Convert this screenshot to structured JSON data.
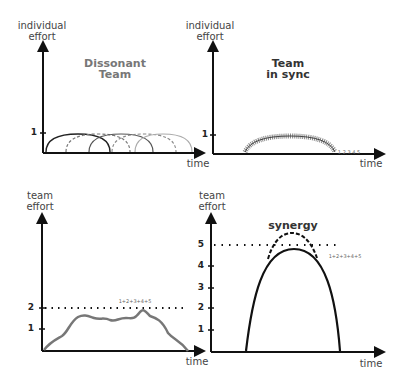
{
  "panels": {
    "top_left": {
      "y_label_line1": "individual",
      "y_label_line2": "effort",
      "x_label": "time",
      "title_line1": "Dissonant",
      "title_line2": "Team",
      "y_tick": "1",
      "arc_labels": [
        "1",
        "2",
        "3",
        "4",
        "5"
      ]
    },
    "top_right": {
      "y_label_line1": "individual",
      "y_label_line2": "effort",
      "x_label": "time",
      "title_line1": "Team",
      "title_line2": "in sync",
      "y_tick": "1",
      "arc_label": "1,2,3,4,5"
    },
    "bottom_left": {
      "y_label_line1": "team",
      "y_label_line2": "effort",
      "x_label": "time",
      "y_ticks": [
        "1",
        "2"
      ],
      "sum_label": "1+2+3+4+5"
    },
    "bottom_right": {
      "y_label_line1": "team",
      "y_label_line2": "effort",
      "x_label": "time",
      "title": "synergy",
      "y_ticks": [
        "1",
        "2",
        "3",
        "4",
        "5"
      ],
      "sum_label": "1+2+3+4+5"
    }
  },
  "colors": {
    "axis": "#111111",
    "curve_dark": "#222222",
    "curve_gray": "#888888",
    "team_curve": "#777777"
  }
}
